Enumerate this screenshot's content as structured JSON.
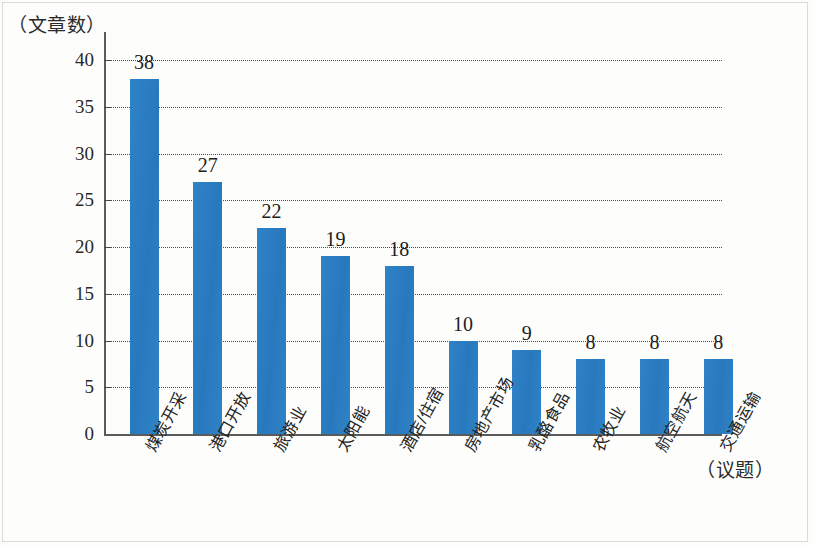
{
  "chart_data": {
    "type": "bar",
    "title": "",
    "subtitle": "",
    "ylabel": "（文章数）",
    "xlabel": "（议题）",
    "categories": [
      "煤炭开采",
      "港口开放",
      "旅游业",
      "太阳能",
      "酒店/住宿",
      "房地产市场",
      "乳酪食品",
      "农牧业",
      "航空航天",
      "交通运输"
    ],
    "values": [
      38,
      27,
      22,
      19,
      18,
      10,
      9,
      8,
      8,
      8
    ],
    "value_labels": [
      "38",
      "27",
      "22",
      "19",
      "18",
      "10",
      "9",
      "8",
      "8",
      "8"
    ],
    "ylim": [
      0,
      40
    ],
    "ytick_values": [
      0,
      5,
      10,
      15,
      20,
      25,
      30,
      35,
      40
    ],
    "ytick_labels": [
      "0",
      "5",
      "10",
      "15",
      "20",
      "25",
      "30",
      "35",
      "40"
    ],
    "grid": "horizontal-dotted",
    "legend": "none",
    "bar_color": "#2b7fc4",
    "axis_color": "#5b5b5b",
    "grid_color": "#4d4d4d",
    "background_color": "#fdfdfb"
  }
}
